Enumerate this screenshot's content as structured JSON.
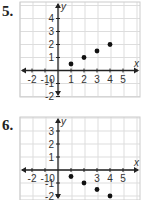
{
  "problems": [
    {
      "number": "5."
    },
    {
      "number": "6."
    }
  ],
  "chart_data": [
    {
      "type": "scatter",
      "title": "5.",
      "xlabel": "x",
      "ylabel": "y",
      "xlim": [
        -3,
        6
      ],
      "ylim": [
        -2.5,
        5
      ],
      "grid": true,
      "x_ticks": [
        "-2",
        "-1",
        "0",
        "1",
        "2",
        "3",
        "4",
        "5"
      ],
      "y_ticks": [
        "4",
        "3",
        "2",
        "1",
        "-1",
        "-2"
      ],
      "points": [
        [
          1,
          0.5
        ],
        [
          2,
          1
        ],
        [
          3,
          1.5
        ],
        [
          4,
          2
        ]
      ]
    },
    {
      "type": "scatter",
      "title": "6.",
      "xlabel": "x",
      "ylabel": "y",
      "xlim": [
        -3,
        6
      ],
      "ylim": [
        -2.5,
        4
      ],
      "grid": true,
      "x_ticks": [
        "-2",
        "-1",
        "0",
        "3",
        "4",
        "5"
      ],
      "y_ticks": [
        "3",
        "2",
        "1",
        "-1",
        "-2"
      ],
      "points": [
        [
          1,
          -0.5
        ],
        [
          2,
          -1
        ],
        [
          3,
          -1.5
        ],
        [
          4,
          -2
        ]
      ]
    }
  ]
}
